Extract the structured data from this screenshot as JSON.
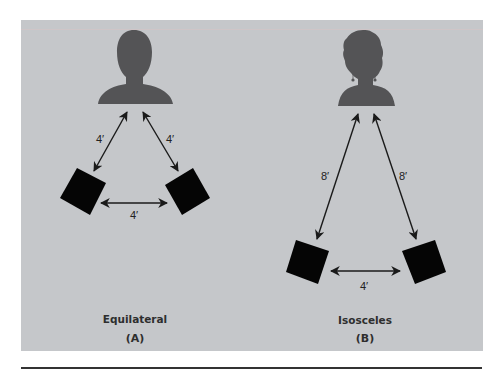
{
  "figure": {
    "colors": {
      "background": "#ffffff",
      "panel": "#c5c7ca",
      "silhouette": "#545456",
      "speaker": "#050505",
      "arrow": "#1a1a1a",
      "text": "#2e2e2e",
      "rule": "#333333"
    },
    "panels": [
      {
        "id": "A",
        "title": "Equilateral",
        "letter": "(A)",
        "listener": "listener-head-silhouette",
        "distances": {
          "listener_to_left_speaker": "4′",
          "listener_to_right_speaker": "4′",
          "speaker_to_speaker": "4′"
        }
      },
      {
        "id": "B",
        "title": "Isosceles",
        "letter": "(B)",
        "listener": "listener-head-silhouette-with-earrings",
        "distances": {
          "listener_to_left_speaker": "8′",
          "listener_to_right_speaker": "8′",
          "speaker_to_speaker": "4′"
        }
      }
    ]
  }
}
